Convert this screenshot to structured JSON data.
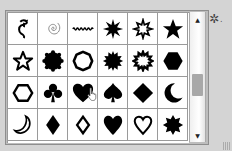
{
  "panel": {
    "title": "Custom Shape Picker",
    "shapes": [
      {
        "name": "ornament",
        "row": 0,
        "col": 0
      },
      {
        "name": "spiral",
        "row": 0,
        "col": 1
      },
      {
        "name": "wavy-line",
        "row": 0,
        "col": 2
      },
      {
        "name": "starburst-12",
        "row": 0,
        "col": 3
      },
      {
        "name": "starburst-outline",
        "row": 0,
        "col": 4
      },
      {
        "name": "star-5-filled",
        "row": 0,
        "col": 5
      },
      {
        "name": "star-5-outline",
        "row": 1,
        "col": 0
      },
      {
        "name": "scalloped-circle-filled",
        "row": 1,
        "col": 1
      },
      {
        "name": "scalloped-circle-outline",
        "row": 1,
        "col": 2
      },
      {
        "name": "seal-filled",
        "row": 1,
        "col": 3
      },
      {
        "name": "seal-outline",
        "row": 1,
        "col": 4
      },
      {
        "name": "hexagon-filled",
        "row": 1,
        "col": 5
      },
      {
        "name": "hexagon-outline",
        "row": 2,
        "col": 0
      },
      {
        "name": "club",
        "row": 2,
        "col": 1
      },
      {
        "name": "heart-filled",
        "row": 2,
        "col": 2
      },
      {
        "name": "spade",
        "row": 2,
        "col": 3
      },
      {
        "name": "diamond-filled",
        "row": 2,
        "col": 4
      },
      {
        "name": "crescent-moon-filled",
        "row": 2,
        "col": 5
      },
      {
        "name": "crescent-moon-outline",
        "row": 3,
        "col": 0
      },
      {
        "name": "diamond-suit-filled",
        "row": 3,
        "col": 1
      },
      {
        "name": "diamond-suit-outline",
        "row": 3,
        "col": 2
      },
      {
        "name": "heart-filled-2",
        "row": 3,
        "col": 3
      },
      {
        "name": "heart-outline",
        "row": 3,
        "col": 4
      },
      {
        "name": "octagram-filled",
        "row": 3,
        "col": 5
      }
    ],
    "hovered_shape": "heart-filled"
  },
  "scrollbar": {
    "up_arrow": "▲",
    "down_arrow": "▼"
  },
  "settings": {
    "icon": "gear-icon",
    "glyph": "✲",
    "menu_indicator": "."
  },
  "colors": {
    "shape_fill": "#000000",
    "cell_bg": "#ffffff",
    "grid_line": "#9a9a9a",
    "panel_bg": "#d4d4d4"
  }
}
